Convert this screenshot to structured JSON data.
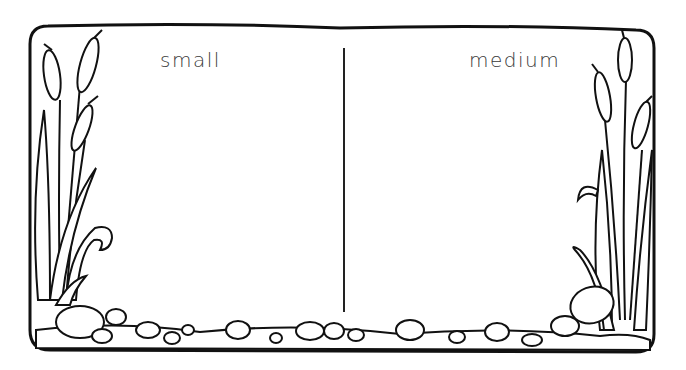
{
  "worksheet": {
    "columns": [
      {
        "label": "small"
      },
      {
        "label": "medium"
      }
    ],
    "border_theme": "cattails-and-pond-stones",
    "colors": {
      "ink": "#111111",
      "paper": "#ffffff",
      "label": "#3a3a3a"
    }
  }
}
